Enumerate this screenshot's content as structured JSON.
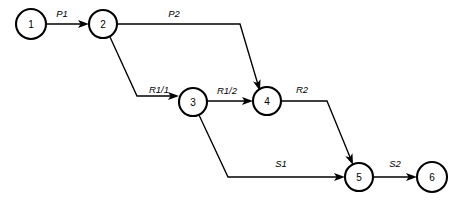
{
  "diagram": {
    "type": "directed-graph",
    "canvas": {
      "width": 463,
      "height": 203,
      "background": "#ffffff"
    },
    "stroke_color": "#000000",
    "node_fill": "#ffffff",
    "nodes": [
      {
        "id": "1",
        "label": "1",
        "cx": 31,
        "cy": 24,
        "r": 15
      },
      {
        "id": "2",
        "label": "2",
        "cx": 103,
        "cy": 24,
        "r": 14
      },
      {
        "id": "3",
        "label": "3",
        "cx": 193,
        "cy": 102,
        "r": 14
      },
      {
        "id": "4",
        "label": "4",
        "cx": 267,
        "cy": 101,
        "r": 14
      },
      {
        "id": "5",
        "label": "5",
        "cx": 359,
        "cy": 177,
        "r": 14
      },
      {
        "id": "6",
        "label": "6",
        "cx": 432,
        "cy": 177,
        "r": 15
      }
    ],
    "edges": [
      {
        "id": "e-p1",
        "label": "P1",
        "from": "1",
        "to": "2",
        "label_x": 62,
        "label_y": 17,
        "path": "M 46 24 L 86 24",
        "arrow_x": 89,
        "arrow_y": 24,
        "arrow_angle": 0
      },
      {
        "id": "e-p2",
        "label": "P2",
        "from": "2",
        "to": "4",
        "label_x": 174,
        "label_y": 17,
        "path": "M 117 24 L 240 24 L 259 88",
        "arrow_x": 260,
        "arrow_y": 91,
        "arrow_angle": 73
      },
      {
        "id": "e-r1-1",
        "label": "R1/1",
        "from": "2",
        "to": "3",
        "label_x": 159,
        "label_y": 93,
        "path": "M 110 37 L 137 96 L 176 96",
        "arrow_x": 179,
        "arrow_y": 96,
        "arrow_angle": 0
      },
      {
        "id": "e-r1-2",
        "label": "R1/2",
        "from": "3",
        "to": "4",
        "label_x": 227,
        "label_y": 94,
        "path": "M 207 101 L 250 101",
        "arrow_x": 253,
        "arrow_y": 101,
        "arrow_angle": 0
      },
      {
        "id": "e-r2",
        "label": "R2",
        "from": "4",
        "to": "5",
        "label_x": 302,
        "label_y": 93,
        "path": "M 281 101 L 327 101 L 352 162",
        "arrow_x": 353,
        "arrow_y": 165,
        "arrow_angle": 68
      },
      {
        "id": "e-s1",
        "label": "S1",
        "from": "3",
        "to": "5",
        "label_x": 281,
        "label_y": 167,
        "path": "M 199 115 L 228 177 L 342 177",
        "arrow_x": 345,
        "arrow_y": 177,
        "arrow_angle": 0
      },
      {
        "id": "e-s2",
        "label": "S2",
        "from": "5",
        "to": "6",
        "label_x": 395,
        "label_y": 167,
        "path": "M 373 177 L 414 177",
        "arrow_x": 417,
        "arrow_y": 177,
        "arrow_angle": 0
      }
    ]
  }
}
